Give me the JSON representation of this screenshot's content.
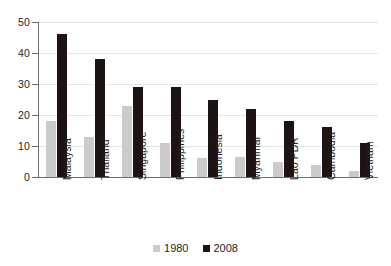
{
  "chart_data": {
    "type": "bar",
    "title": "",
    "subtitle": "",
    "xlabel": "",
    "ylabel": "",
    "ylim": [
      0,
      50
    ],
    "yticks": [
      0,
      10,
      20,
      30,
      40,
      50
    ],
    "ytick_labels": [
      "0",
      "10",
      "20",
      "30",
      "40",
      "50"
    ],
    "grid": true,
    "legend_position": "bottom-center",
    "categories": [
      "Malaysia",
      "Thailand",
      "Singapore",
      "Philippines",
      "Indonesia",
      "Myanmar",
      "Lao PDR",
      "Cambodia",
      "Vietnam"
    ],
    "series": [
      {
        "name": "1980",
        "color": "#cbcbcb",
        "values": [
          18,
          13,
          23,
          11,
          6,
          6.5,
          5,
          4,
          2
        ]
      },
      {
        "name": "2008",
        "color": "#1b1413",
        "values": [
          46,
          38,
          29,
          29,
          25,
          22,
          18,
          16,
          11
        ]
      }
    ]
  },
  "legend": {
    "items": [
      {
        "label": "1980",
        "swatch_name": "legend-swatch-1980",
        "color": "#cbcbcb"
      },
      {
        "label": "2008",
        "swatch_name": "legend-swatch-2008",
        "color": "#1b1413"
      }
    ]
  }
}
